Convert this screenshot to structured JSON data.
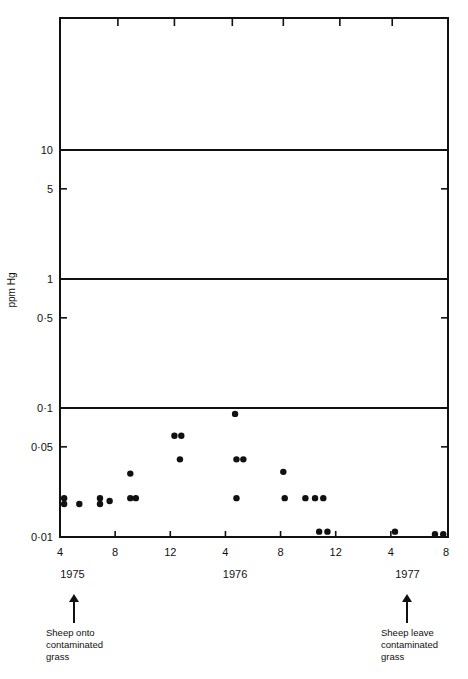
{
  "chart_data": {
    "type": "scatter",
    "title": "",
    "xlabel": "",
    "ylabel": "ppm Hg",
    "yscale": "log",
    "ylim": [
      0.01,
      100
    ],
    "y_ticks": [
      {
        "value": 0.01,
        "label": "0·01",
        "style": "axis"
      },
      {
        "value": 0.05,
        "label": "0·05",
        "style": "tick"
      },
      {
        "value": 0.1,
        "label": "0·1",
        "style": "line"
      },
      {
        "value": 0.5,
        "label": "0·5",
        "style": "tick"
      },
      {
        "value": 1,
        "label": "1",
        "style": "line"
      },
      {
        "value": 5,
        "label": "5",
        "style": "tick"
      },
      {
        "value": 10,
        "label": "10",
        "style": "line"
      }
    ],
    "x_unit": "months since April 1975",
    "xlim": [
      0,
      28
    ],
    "x_ticks": [
      {
        "m": 0,
        "label": "4"
      },
      {
        "m": 4,
        "label": "8"
      },
      {
        "m": 8,
        "label": "12"
      },
      {
        "m": 12,
        "label": "4"
      },
      {
        "m": 16,
        "label": "8"
      },
      {
        "m": 20,
        "label": "12"
      },
      {
        "m": 24,
        "label": "4"
      },
      {
        "m": 28,
        "label": "8"
      }
    ],
    "year_labels": [
      {
        "m": 0.9,
        "label": "1975"
      },
      {
        "m": 12.7,
        "label": "1976"
      },
      {
        "m": 25.2,
        "label": "1977"
      }
    ],
    "points": [
      {
        "m": 0.3,
        "v": 0.02
      },
      {
        "m": 0.3,
        "v": 0.018
      },
      {
        "m": 1.4,
        "v": 0.018
      },
      {
        "m": 2.9,
        "v": 0.02
      },
      {
        "m": 2.9,
        "v": 0.018
      },
      {
        "m": 3.6,
        "v": 0.019
      },
      {
        "m": 5.1,
        "v": 0.031
      },
      {
        "m": 5.1,
        "v": 0.02
      },
      {
        "m": 5.5,
        "v": 0.02
      },
      {
        "m": 8.3,
        "v": 0.061
      },
      {
        "m": 8.8,
        "v": 0.061
      },
      {
        "m": 8.7,
        "v": 0.04
      },
      {
        "m": 12.7,
        "v": 0.09
      },
      {
        "m": 12.8,
        "v": 0.04
      },
      {
        "m": 13.3,
        "v": 0.04
      },
      {
        "m": 12.8,
        "v": 0.02
      },
      {
        "m": 16.2,
        "v": 0.032
      },
      {
        "m": 16.3,
        "v": 0.02
      },
      {
        "m": 17.8,
        "v": 0.02
      },
      {
        "m": 18.5,
        "v": 0.02
      },
      {
        "m": 19.1,
        "v": 0.02
      },
      {
        "m": 18.8,
        "v": 0.011
      },
      {
        "m": 19.4,
        "v": 0.011
      },
      {
        "m": 24.3,
        "v": 0.011
      },
      {
        "m": 27.2,
        "v": 0.0105
      },
      {
        "m": 27.8,
        "v": 0.0105
      }
    ],
    "top_ticks_m": [
      4.2,
      8.3,
      12.5,
      16.2,
      20.3,
      24.1
    ],
    "annotations": [
      {
        "m": 0.9,
        "text": "Sheep onto contaminated grass"
      },
      {
        "m": 25.2,
        "text": "Sheep leave contaminated grass"
      }
    ],
    "grid": false,
    "legend": null
  },
  "annotations": {
    "start": {
      "line1": "Sheep onto",
      "line2": "contaminated",
      "line3": "grass"
    },
    "end": {
      "line1": "Sheep leave",
      "line2": "contaminated",
      "line3": "grass"
    }
  },
  "colors": {
    "ink": "#111111",
    "background": "#ffffff"
  }
}
